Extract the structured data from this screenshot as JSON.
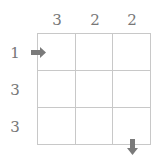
{
  "puzzle": {
    "column_clues": [
      "3",
      "2",
      "2"
    ],
    "row_clues": [
      "1",
      "3",
      "3"
    ],
    "rows": 3,
    "cols": 3,
    "entry_arrow": {
      "direction": "right",
      "row": 1,
      "side": "left"
    },
    "exit_arrow": {
      "direction": "down",
      "col": 3,
      "side": "bottom"
    },
    "colors": {
      "clue_text": "#777777",
      "grid_line": "#c8c8c8",
      "arrow": "#7a7a7a"
    }
  }
}
